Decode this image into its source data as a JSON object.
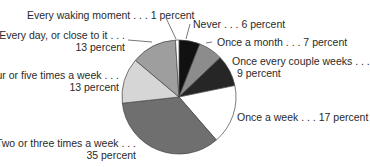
{
  "chart_data": {
    "type": "pie",
    "title": "",
    "start_angle_deg": 0,
    "direction": "clockwise",
    "slices": [
      {
        "label": "Never",
        "value": 6,
        "color": "#111111"
      },
      {
        "label": "Once a month",
        "value": 7,
        "color": "#8c8c8c"
      },
      {
        "label": "Once every couple weeks",
        "value": 9,
        "color": "#262626"
      },
      {
        "label": "Once a week",
        "value": 17,
        "color": "#ffffff"
      },
      {
        "label": "Two or three times a week",
        "value": 35,
        "color": "#6f6f6f"
      },
      {
        "label": "Four or five times a week",
        "value": 13,
        "color": "#d6d6d6"
      },
      {
        "label": "Every day, or close to it",
        "value": 13,
        "color": "#9e9e9e"
      },
      {
        "label": "Every waking moment",
        "value": 1,
        "color": "#ffffff"
      }
    ],
    "annotations": [
      "Every waking moment . . . 1 percent",
      "Never . . . 6 percent",
      "Once a month . . . 7 percent",
      "Once every couple weeks . . . 9 percent",
      "Once a week . . . 17 percent",
      "Two or three times a week . . . 35 percent",
      "Four or five times a week . . . 13 percent",
      "Every day, or close to it . . . 13 percent"
    ]
  },
  "labels": {
    "waking": "Every waking moment . . . 1 percent",
    "never": "Never . . . 6 percent",
    "month": "Once a month . . . 7 percent",
    "couple_l1": "Once every couple weeks . . .",
    "couple_l2": "9 percent",
    "week": "Once a week . . . 17 percent",
    "two_three_l1": "Two or three times a week . . .",
    "two_three_l2": "35 percent",
    "four_five_l1": "Four or five times a week . . .",
    "four_five_l2": "13 percent",
    "everyday_l1": "Every day, or close to it . . .",
    "everyday_l2": "13 percent"
  }
}
